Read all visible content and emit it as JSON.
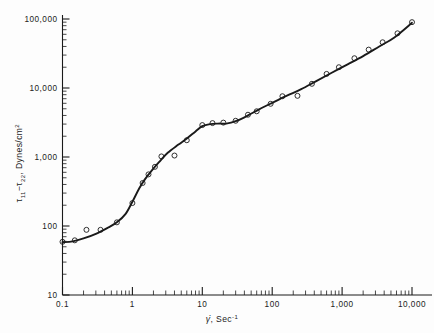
{
  "figure": {
    "background": "#fdfdfd",
    "ink_color": "#1a1a1a"
  },
  "axes": {
    "x": {
      "title_main": "γ̇",
      "title_rest": ", Sec",
      "title_exp": "-1",
      "scale": "log",
      "range": [
        0.1,
        10000
      ],
      "tick_labels": [
        "0.1",
        "1",
        "10",
        "100",
        "1,000",
        "10,000"
      ],
      "tick_values": [
        0.1,
        1,
        10,
        100,
        1000,
        10000
      ],
      "minor_ticks": true
    },
    "y": {
      "title_tau": "τ",
      "title_sub1": "11",
      "title_dash": "−",
      "title_tau2": "τ",
      "title_sub2": "22",
      "title_rest": ", Dynes/cm",
      "title_exp": "2",
      "scale": "log",
      "range": [
        10,
        100000
      ],
      "tick_labels": [
        "10",
        "100",
        "1,000",
        "10,000",
        "100,000"
      ],
      "tick_values": [
        10,
        100,
        1000,
        10000,
        100000
      ],
      "minor_ticks": true
    }
  },
  "chart_data": {
    "type": "scatter",
    "title": "",
    "xlabel": "γ̇, Sec⁻¹",
    "ylabel": "τ₁₁ − τ₂₂, Dynes/cm²",
    "xscale": "log",
    "yscale": "log",
    "xlim": [
      0.1,
      10000
    ],
    "ylim": [
      10,
      100000
    ],
    "grid": false,
    "legend": "none",
    "marker": "open-circle",
    "series": [
      {
        "name": "measured",
        "marker": "open-circle",
        "points": [
          [
            0.1,
            59
          ],
          [
            0.15,
            62
          ],
          [
            0.22,
            88
          ],
          [
            0.35,
            88
          ],
          [
            0.6,
            113
          ],
          [
            1.0,
            215
          ],
          [
            1.4,
            420
          ],
          [
            1.7,
            560
          ],
          [
            2.1,
            720
          ],
          [
            2.6,
            1020
          ],
          [
            4.0,
            1050
          ],
          [
            6.0,
            1750
          ],
          [
            10.0,
            2900
          ],
          [
            14.0,
            3100
          ],
          [
            20.0,
            3150
          ],
          [
            30.0,
            3350
          ],
          [
            45.0,
            4100
          ],
          [
            60.0,
            4600
          ],
          [
            95.0,
            5900
          ],
          [
            140.0,
            7600
          ],
          [
            230.0,
            7700
          ],
          [
            370.0,
            11500
          ],
          [
            600.0,
            16000
          ],
          [
            900.0,
            20000
          ],
          [
            1500.0,
            27000
          ],
          [
            2400.0,
            36000
          ],
          [
            3800.0,
            46000
          ],
          [
            6200.0,
            62000
          ],
          [
            10000.0,
            90000
          ]
        ]
      },
      {
        "name": "fitted-curve",
        "marker": "line",
        "points": [
          [
            0.1,
            58
          ],
          [
            0.14,
            60
          ],
          [
            0.2,
            66
          ],
          [
            0.3,
            77
          ],
          [
            0.45,
            95
          ],
          [
            0.6,
            113
          ],
          [
            0.8,
            150
          ],
          [
            1.0,
            225
          ],
          [
            1.25,
            350
          ],
          [
            1.5,
            470
          ],
          [
            1.9,
            640
          ],
          [
            2.4,
            840
          ],
          [
            3.2,
            1150
          ],
          [
            4.5,
            1500
          ],
          [
            6.0,
            1850
          ],
          [
            8.0,
            2350
          ],
          [
            10.0,
            2800
          ],
          [
            13.0,
            3000
          ],
          [
            17.0,
            3050
          ],
          [
            22.0,
            3050
          ],
          [
            30.0,
            3300
          ],
          [
            45.0,
            4000
          ],
          [
            65.0,
            4900
          ],
          [
            100.0,
            6100
          ],
          [
            160.0,
            7700
          ],
          [
            260.0,
            9600
          ],
          [
            420.0,
            12500
          ],
          [
            700.0,
            16500
          ],
          [
            1200.0,
            22000
          ],
          [
            2000.0,
            29000
          ],
          [
            3400.0,
            40000
          ],
          [
            5600.0,
            54000
          ],
          [
            10000.0,
            88000
          ]
        ]
      }
    ]
  }
}
